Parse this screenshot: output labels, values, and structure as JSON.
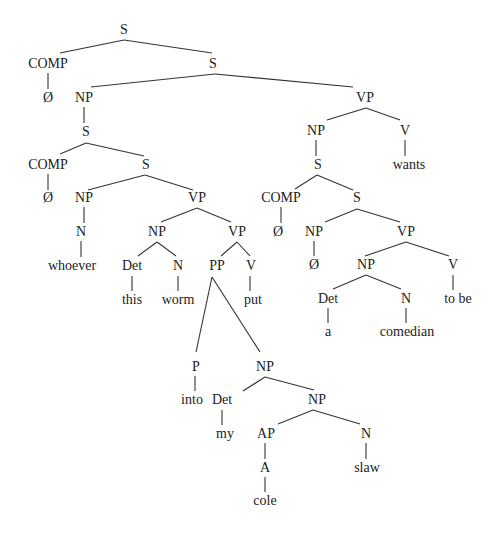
{
  "diagram": {
    "type": "syntax-tree",
    "colors": {
      "text": "#222222",
      "line": "#333333",
      "background": "#ffffff"
    },
    "nodes": [
      {
        "id": "s0",
        "label": "S",
        "x": 124,
        "y": 31
      },
      {
        "id": "comp0",
        "label": "COMP",
        "x": 48,
        "y": 65
      },
      {
        "id": "s1",
        "label": "S",
        "x": 213,
        "y": 65
      },
      {
        "id": "null0",
        "label": "Ø",
        "x": 48,
        "y": 99
      },
      {
        "id": "np0",
        "label": "NP",
        "x": 84,
        "y": 99
      },
      {
        "id": "vp0",
        "label": "VP",
        "x": 365,
        "y": 99
      },
      {
        "id": "s2",
        "label": "S",
        "x": 86,
        "y": 133
      },
      {
        "id": "np1",
        "label": "NP",
        "x": 316,
        "y": 132
      },
      {
        "id": "v0",
        "label": "V",
        "x": 405,
        "y": 132
      },
      {
        "id": "comp1",
        "label": "COMP",
        "x": 48,
        "y": 166
      },
      {
        "id": "s3",
        "label": "S",
        "x": 146,
        "y": 166
      },
      {
        "id": "s4",
        "label": "S",
        "x": 318,
        "y": 166
      },
      {
        "id": "wants",
        "label": "wants",
        "x": 409,
        "y": 166
      },
      {
        "id": "null1",
        "label": "Ø",
        "x": 48,
        "y": 199
      },
      {
        "id": "np2",
        "label": "NP",
        "x": 84,
        "y": 199
      },
      {
        "id": "vp1",
        "label": "VP",
        "x": 197,
        "y": 199
      },
      {
        "id": "comp2",
        "label": "COMP",
        "x": 281,
        "y": 199
      },
      {
        "id": "s5",
        "label": "S",
        "x": 357,
        "y": 199
      },
      {
        "id": "n0",
        "label": "N",
        "x": 81,
        "y": 233
      },
      {
        "id": "np3",
        "label": "NP",
        "x": 157,
        "y": 233
      },
      {
        "id": "vp2",
        "label": "VP",
        "x": 237,
        "y": 233
      },
      {
        "id": "null2",
        "label": "Ø",
        "x": 278,
        "y": 233
      },
      {
        "id": "np4",
        "label": "NP",
        "x": 314,
        "y": 233
      },
      {
        "id": "vp3",
        "label": "VP",
        "x": 406,
        "y": 233
      },
      {
        "id": "whoever",
        "label": "whoever",
        "x": 72,
        "y": 267
      },
      {
        "id": "det0",
        "label": "Det",
        "x": 132,
        "y": 267
      },
      {
        "id": "n1",
        "label": "N",
        "x": 178,
        "y": 267
      },
      {
        "id": "pp0",
        "label": "PP",
        "x": 217,
        "y": 267
      },
      {
        "id": "v1",
        "label": "V",
        "x": 251,
        "y": 267
      },
      {
        "id": "null3",
        "label": "Ø",
        "x": 314,
        "y": 266
      },
      {
        "id": "np5",
        "label": "NP",
        "x": 366,
        "y": 266
      },
      {
        "id": "v2",
        "label": "V",
        "x": 453,
        "y": 266
      },
      {
        "id": "this",
        "label": "this",
        "x": 132,
        "y": 301
      },
      {
        "id": "worm",
        "label": "worm",
        "x": 178,
        "y": 301
      },
      {
        "id": "put",
        "label": "put",
        "x": 253,
        "y": 301
      },
      {
        "id": "det1",
        "label": "Det",
        "x": 328,
        "y": 300
      },
      {
        "id": "n2",
        "label": "N",
        "x": 406,
        "y": 300
      },
      {
        "id": "tobe",
        "label": "to be",
        "x": 458,
        "y": 300
      },
      {
        "id": "a",
        "label": "a",
        "x": 328,
        "y": 333
      },
      {
        "id": "comedian",
        "label": "comedian",
        "x": 407,
        "y": 333
      },
      {
        "id": "p0",
        "label": "P",
        "x": 196,
        "y": 368
      },
      {
        "id": "np6",
        "label": "NP",
        "x": 265,
        "y": 368
      },
      {
        "id": "into",
        "label": "into",
        "x": 192,
        "y": 401
      },
      {
        "id": "det2",
        "label": "Det",
        "x": 222,
        "y": 401
      },
      {
        "id": "np7",
        "label": "NP",
        "x": 317,
        "y": 401
      },
      {
        "id": "my",
        "label": "my",
        "x": 225,
        "y": 435
      },
      {
        "id": "ap0",
        "label": "AP",
        "x": 266,
        "y": 435
      },
      {
        "id": "n3",
        "label": "N",
        "x": 366,
        "y": 435
      },
      {
        "id": "a0",
        "label": "A",
        "x": 265,
        "y": 469
      },
      {
        "id": "slaw",
        "label": "slaw",
        "x": 367,
        "y": 469
      },
      {
        "id": "cole",
        "label": "cole",
        "x": 265,
        "y": 502
      }
    ],
    "edges": [
      [
        124,
        40,
        60,
        53
      ],
      [
        124,
        40,
        212,
        53
      ],
      [
        48,
        73,
        48,
        89
      ],
      [
        215,
        74,
        91,
        87
      ],
      [
        215,
        74,
        353,
        87
      ],
      [
        84,
        107,
        84,
        123
      ],
      [
        366,
        108,
        327,
        120
      ],
      [
        366,
        108,
        400,
        120
      ],
      [
        86,
        143,
        60,
        154
      ],
      [
        86,
        143,
        144,
        156
      ],
      [
        316,
        140,
        316,
        156
      ],
      [
        405,
        140,
        405,
        156
      ],
      [
        317,
        175,
        295,
        189
      ],
      [
        317,
        175,
        353,
        190
      ],
      [
        48,
        174,
        48,
        190
      ],
      [
        145,
        175,
        88,
        190
      ],
      [
        145,
        175,
        193,
        190
      ],
      [
        357,
        209,
        325,
        222
      ],
      [
        357,
        209,
        400,
        222
      ],
      [
        281,
        207,
        281,
        223
      ],
      [
        84,
        207,
        84,
        223
      ],
      [
        197,
        208,
        161,
        222
      ],
      [
        197,
        208,
        231,
        222
      ],
      [
        314,
        241,
        314,
        256
      ],
      [
        81,
        241,
        81,
        257
      ],
      [
        406,
        242,
        365,
        256
      ],
      [
        406,
        242,
        449,
        256
      ],
      [
        157,
        242,
        138,
        256
      ],
      [
        157,
        242,
        176,
        256
      ],
      [
        237,
        242,
        221,
        256
      ],
      [
        237,
        242,
        250,
        256
      ],
      [
        366,
        275,
        333,
        289
      ],
      [
        366,
        275,
        401,
        289
      ],
      [
        453,
        275,
        453,
        290
      ],
      [
        132,
        276,
        132,
        291
      ],
      [
        178,
        276,
        178,
        291
      ],
      [
        250,
        276,
        250,
        291
      ],
      [
        212,
        277,
        196,
        352
      ],
      [
        212,
        277,
        260,
        352
      ],
      [
        328,
        308,
        328,
        323
      ],
      [
        406,
        308,
        406,
        323
      ],
      [
        195,
        376,
        195,
        391
      ],
      [
        265,
        377,
        243,
        391
      ],
      [
        265,
        377,
        314,
        390
      ],
      [
        222,
        410,
        222,
        425
      ],
      [
        313,
        410,
        278,
        424
      ],
      [
        313,
        410,
        360,
        424
      ],
      [
        265,
        443,
        265,
        459
      ],
      [
        366,
        443,
        366,
        459
      ],
      [
        265,
        477,
        265,
        492
      ]
    ]
  }
}
